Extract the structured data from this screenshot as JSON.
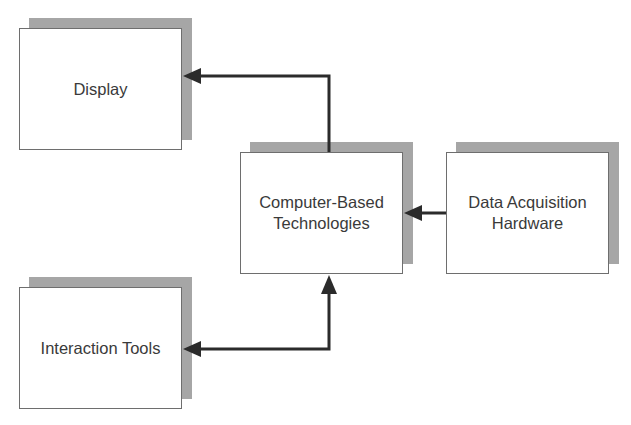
{
  "diagram": {
    "type": "block-diagram",
    "nodes": [
      {
        "id": "display",
        "label": "Display"
      },
      {
        "id": "computer",
        "label": "Computer-Based\nTechnologies"
      },
      {
        "id": "daq",
        "label": "Data Acquisition\nHardware"
      },
      {
        "id": "interaction",
        "label": "Interaction Tools"
      }
    ],
    "edges": [
      {
        "from": "computer",
        "to": "display",
        "direction": "one-way"
      },
      {
        "from": "daq",
        "to": "computer",
        "direction": "one-way"
      },
      {
        "from": "interaction",
        "to": "computer",
        "direction": "two-way"
      }
    ],
    "colors": {
      "shadow": "#a6a6a6",
      "border": "#6e6e6e",
      "arrow": "#2b2b2b",
      "text": "#3a3a3a"
    }
  }
}
